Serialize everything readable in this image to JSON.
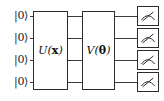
{
  "diagram": {
    "type": "quantum-circuit",
    "title": "",
    "qubit_count": 4,
    "wires": [
      {
        "index": 0,
        "ket_label": "|0⟩",
        "y": 16
      },
      {
        "index": 1,
        "ket_label": "|0⟩",
        "y": 38
      },
      {
        "index": 2,
        "ket_label": "|0⟩",
        "y": 60
      },
      {
        "index": 3,
        "ket_label": "|0⟩",
        "y": 82
      }
    ],
    "gates": [
      {
        "id": "encoding-gate",
        "name": "U",
        "argument": "x",
        "label_full": "U(x)",
        "argument_style": "bold",
        "spans_qubits": [
          0,
          1,
          2,
          3
        ],
        "x": 33,
        "y": 11,
        "width": 35,
        "height": 79
      },
      {
        "id": "variational-gate",
        "name": "V",
        "argument": "θ",
        "label_full": "V(θ)",
        "argument_style": "bold",
        "spans_qubits": [
          0,
          1,
          2,
          3
        ],
        "x": 82,
        "y": 11,
        "width": 33,
        "height": 79
      }
    ],
    "measurements": [
      {
        "id": "measure-q0",
        "qubit": 0,
        "icon": "measurement-meter-icon",
        "x": 137,
        "y": 6,
        "width": 22,
        "height": 20
      },
      {
        "id": "measure-q1",
        "qubit": 1,
        "icon": "measurement-meter-icon",
        "x": 137,
        "y": 28,
        "width": 22,
        "height": 20
      },
      {
        "id": "measure-q2",
        "qubit": 2,
        "icon": "measurement-meter-icon",
        "x": 137,
        "y": 50,
        "width": 22,
        "height": 20
      },
      {
        "id": "measure-q3",
        "qubit": 3,
        "icon": "measurement-meter-icon",
        "x": 137,
        "y": 72,
        "width": 22,
        "height": 20
      }
    ],
    "colors": {
      "background": "#ffffff",
      "wire": "#3a3a3a",
      "box_border": "#2b2b2b",
      "text": "#111111"
    }
  }
}
